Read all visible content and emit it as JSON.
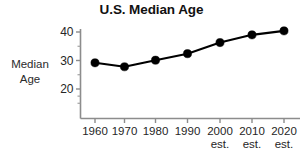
{
  "chart_data": {
    "type": "line",
    "title": "U.S. Median Age",
    "xlabel": "",
    "ylabel": "Median Age",
    "ylabel_lines": [
      "Median",
      "Age"
    ],
    "categories": [
      "1960",
      "1970",
      "1980",
      "1990",
      "2000",
      "2010",
      "2020"
    ],
    "category_sublabels": [
      "",
      "",
      "",
      "",
      "est.",
      "est.",
      "est."
    ],
    "values": [
      29.2,
      27.8,
      30.1,
      32.4,
      36.3,
      39.0,
      40.4
    ],
    "ylim": [
      15,
      42
    ],
    "y_ticks": [
      20,
      30,
      40
    ],
    "y_tick_labels": [
      "20",
      "30",
      "40"
    ],
    "y_minor_ticks": [
      25,
      35
    ],
    "grid": false,
    "legend": false,
    "legend_position": "none",
    "marker": "filled-circle",
    "line_color": "#000000",
    "marker_color": "#000000",
    "axis_color": "#8c8c8c",
    "text_color": "#262626",
    "background_color": "#ffffff"
  },
  "figure": {
    "title_label": "U.S. Median Age",
    "y_axis_title_line1": "Median",
    "y_axis_title_line2": "Age",
    "partial_caption": ""
  }
}
